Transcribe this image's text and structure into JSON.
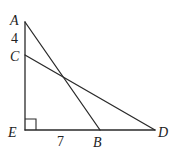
{
  "diagram": {
    "type": "geometry",
    "points": {
      "A": {
        "label": "A",
        "x": 25,
        "y": 22
      },
      "C": {
        "label": "C",
        "x": 25,
        "y": 55
      },
      "E": {
        "label": "E",
        "x": 25,
        "y": 130
      },
      "B": {
        "label": "B",
        "x": 100,
        "y": 130
      },
      "D": {
        "label": "D",
        "x": 155,
        "y": 130
      }
    },
    "segments": [
      {
        "from": "A",
        "to": "E"
      },
      {
        "from": "E",
        "to": "D"
      },
      {
        "from": "A",
        "to": "B"
      },
      {
        "from": "C",
        "to": "D"
      }
    ],
    "measurements": {
      "AC": "4",
      "EB": "7"
    },
    "right_angle_at": "E",
    "stroke_color": "#2a2a2a"
  }
}
